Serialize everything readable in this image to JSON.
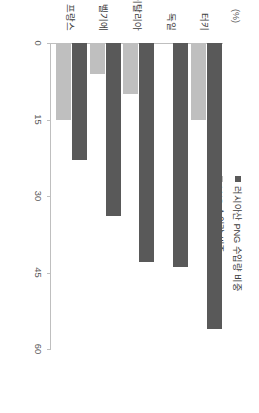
{
  "figure": {
    "unit_label": "(%)",
    "background": "#ffffff"
  },
  "legend": {
    "position": "top-left",
    "items": [
      {
        "label": "러시아산 PNG 수입량 비중",
        "color": "#595959",
        "marker": "square-icon"
      },
      {
        "label": "LNG 수입량 비중",
        "color": "#bfbfbf",
        "marker": "square-icon"
      }
    ]
  },
  "axes": {
    "y_ticks": [
      "0",
      "15",
      "30",
      "45",
      "60"
    ],
    "y_min": 0,
    "y_max": 60,
    "x_categories": [
      "터키",
      "독일",
      "이탈리아",
      "벨기에",
      "프랑스"
    ]
  },
  "chart_data": {
    "type": "bar",
    "title": "",
    "subtitle": "",
    "xlabel": "",
    "ylabel": "(%)",
    "ylim": [
      0,
      60
    ],
    "grid": false,
    "legend_position": "top-left",
    "orientation": "vertical-rendered-rotated-90cw",
    "categories": [
      "터키",
      "독일",
      "이탈리아",
      "벨기에",
      "프랑스"
    ],
    "series": [
      {
        "name": "러시아산 PNG 수입량 비중",
        "color": "#595959",
        "values": [
          56,
          44,
          43,
          34,
          23
        ]
      },
      {
        "name": "LNG 수입량 비중",
        "color": "#bfbfbf",
        "values": [
          15,
          0,
          10,
          6,
          15
        ]
      }
    ]
  }
}
